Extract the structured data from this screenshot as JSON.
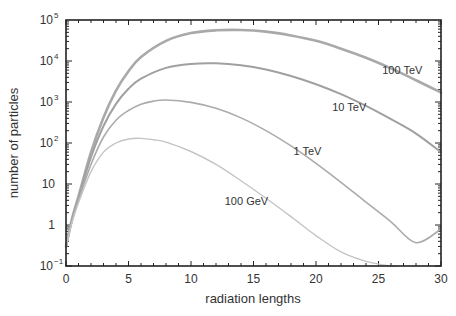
{
  "chart_data": {
    "type": "line",
    "title": "",
    "xlabel": "radiation lengths",
    "ylabel": "number of particles",
    "xlim": [
      0,
      30
    ],
    "ylim": [
      0.1,
      100000
    ],
    "yscale": "log",
    "grid": false,
    "legend": "inline labels",
    "x_ticks": [
      "0",
      "5",
      "10",
      "15",
      "20",
      "25",
      "30"
    ],
    "y_ticks": [
      "10^-1",
      "1",
      "10",
      "10^2",
      "10^3",
      "10^4",
      "10^5"
    ],
    "series": [
      {
        "name": "100 TeV",
        "color": "#a9a9a9",
        "width": 2.6,
        "x": [
          0,
          0.5,
          1,
          2,
          3,
          4,
          5,
          6,
          8,
          10,
          12,
          14,
          16,
          18,
          20,
          22,
          24,
          26,
          28,
          30
        ],
        "y": [
          0.3,
          1.5,
          5,
          60,
          420,
          1900,
          5600,
          12500,
          31000,
          48000,
          56000,
          57000,
          52000,
          42000,
          31000,
          20000,
          12000,
          6600,
          3400,
          1700
        ]
      },
      {
        "name": "10 TeV",
        "color": "#a0a0a0",
        "width": 2.0,
        "x": [
          0,
          0.5,
          1,
          2,
          3,
          4,
          5,
          6,
          8,
          10,
          12,
          14,
          16,
          18,
          20,
          22,
          24,
          26,
          28,
          30
        ],
        "y": [
          0.3,
          1.4,
          4.5,
          45,
          260,
          900,
          2100,
          3700,
          6800,
          8500,
          8800,
          7900,
          6200,
          4300,
          2700,
          1550,
          800,
          380,
          170,
          60
        ]
      },
      {
        "name": "1 TeV",
        "color": "#ababab",
        "width": 1.6,
        "x": [
          0,
          0.5,
          1,
          2,
          3,
          4,
          5,
          6,
          7,
          8,
          10,
          12,
          14,
          16,
          18,
          20,
          22,
          24,
          26,
          28,
          30
        ],
        "y": [
          0.3,
          1.3,
          4,
          30,
          140,
          360,
          620,
          880,
          1050,
          1120,
          980,
          700,
          410,
          200,
          85,
          32,
          11,
          3.6,
          1.2,
          0.37,
          0.8
        ]
      },
      {
        "name": "100 GeV",
        "color": "#c4c4c4",
        "width": 1.4,
        "x": [
          0,
          0.5,
          1,
          2,
          3,
          4,
          5,
          6,
          7,
          8,
          10,
          12,
          14,
          16,
          18,
          20,
          22,
          24,
          26,
          26.4
        ],
        "y": [
          0.3,
          1.2,
          3.5,
          20,
          60,
          100,
          125,
          130,
          120,
          105,
          62,
          30,
          12,
          4.5,
          1.6,
          0.55,
          0.22,
          0.13,
          0.1,
          0.1
        ]
      }
    ],
    "annotations": [
      {
        "text": "100 TeV",
        "x": 25.3,
        "y": 4700
      },
      {
        "text": "10 TeV",
        "x": 21.3,
        "y": 600
      },
      {
        "text": "1 TeV",
        "x": 18.2,
        "y": 50
      },
      {
        "text": "100 GeV",
        "x": 12.7,
        "y": 3
      }
    ]
  }
}
